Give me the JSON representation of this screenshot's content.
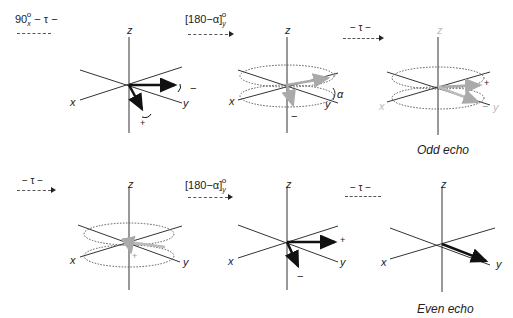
{
  "pulses": [
    {
      "id": "p1",
      "main": "90",
      "sub": "x",
      "sup": "o",
      "suffix": " − τ −",
      "arrow": false
    },
    {
      "id": "p2",
      "main": "[180−α]",
      "sub": "y",
      "sup": "o",
      "suffix": "",
      "arrow": true
    },
    {
      "id": "p3",
      "main": "− τ −",
      "sub": "",
      "sup": "",
      "suffix": "",
      "arrow": true
    },
    {
      "id": "p4",
      "main": "− τ −",
      "sub": "",
      "sup": "",
      "suffix": "",
      "arrow": true
    },
    {
      "id": "p5",
      "main": "[180−α]",
      "sub": "y",
      "sup": "o",
      "suffix": "",
      "arrow": true
    },
    {
      "id": "p6",
      "main": "− τ −",
      "sub": "",
      "sup": "",
      "suffix": "",
      "arrow": false
    }
  ],
  "axes": {
    "x": "x",
    "y": "y",
    "z": "z"
  },
  "signs": {
    "plus": "+",
    "minus": "−"
  },
  "angle_label": "α",
  "captions": {
    "odd": "Odd echo",
    "even": "Even echo"
  },
  "colors": {
    "axis": "#333333",
    "vector": "#111111",
    "faded_vector": "#aaaaaa",
    "ring": "#555555",
    "faded_label": "#bbbbbb"
  }
}
